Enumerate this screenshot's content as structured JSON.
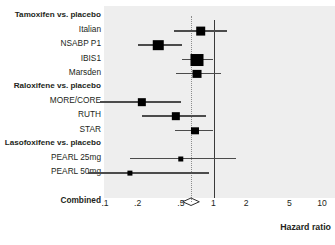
{
  "chart_data": {
    "type": "forest",
    "title": "",
    "xlabel": "Hazard ratio",
    "ylabel": "",
    "xscale": "log",
    "xlim": [
      0.1,
      10
    ],
    "xticks": [
      0.1,
      0.2,
      0.5,
      1,
      2,
      5,
      10
    ],
    "xtick_labels": [
      ".1",
      ".2",
      ".5",
      "1",
      "2",
      "5",
      "10"
    ],
    "null_line": 1,
    "pooled_line": 0.62,
    "grid": false,
    "legend": "none",
    "rows": [
      {
        "kind": "group",
        "label": "Tamoxifen vs. placebo"
      },
      {
        "kind": "study",
        "label": "Italian",
        "hr": 0.76,
        "ci_low": 0.43,
        "ci_high": 1.32,
        "weight": 0.62
      },
      {
        "kind": "study",
        "label": "NSABP P1",
        "hr": 0.31,
        "ci_low": 0.2,
        "ci_high": 0.51,
        "weight": 0.72
      },
      {
        "kind": "study",
        "label": "IBIS1",
        "hr": 0.7,
        "ci_low": 0.51,
        "ci_high": 1.0,
        "weight": 1.0
      },
      {
        "kind": "study",
        "label": "Marsden",
        "hr": 0.7,
        "ci_low": 0.45,
        "ci_high": 1.18,
        "weight": 0.55
      },
      {
        "kind": "group",
        "label": "Raloxifene vs. placebo"
      },
      {
        "kind": "study",
        "label": "MORE/CORE",
        "hr": 0.22,
        "ci_low": 0.09,
        "ci_high": 0.5,
        "weight": 0.48
      },
      {
        "kind": "study",
        "label": "RUTH",
        "hr": 0.45,
        "ci_low": 0.22,
        "ci_high": 0.86,
        "weight": 0.48
      },
      {
        "kind": "study",
        "label": "STAR",
        "hr": 0.67,
        "ci_low": 0.44,
        "ci_high": 1.0,
        "weight": 0.45
      },
      {
        "kind": "group",
        "label": "Lasofoxifene vs. placebo"
      },
      {
        "kind": "study",
        "label": "PEARL 25mg",
        "hr": 0.5,
        "ci_low": 0.17,
        "ci_high": 1.62,
        "weight": 0.16
      },
      {
        "kind": "study",
        "label": "PEARL 50mg",
        "hr": 0.17,
        "ci_low": 0.07,
        "ci_high": 0.9,
        "weight": 0.13
      },
      {
        "kind": "blank",
        "label": ""
      },
      {
        "kind": "summary",
        "label": "Combined",
        "hr": 0.62,
        "ci_low": 0.52,
        "ci_high": 0.74
      }
    ],
    "colors": {
      "panel_background": "#eeeeee",
      "marker": "#000000",
      "ci_line": "#4b4b4b",
      "null_line": "#3a3a3a",
      "pooled_line": "#8c8c8c",
      "text": "#231f20"
    }
  }
}
